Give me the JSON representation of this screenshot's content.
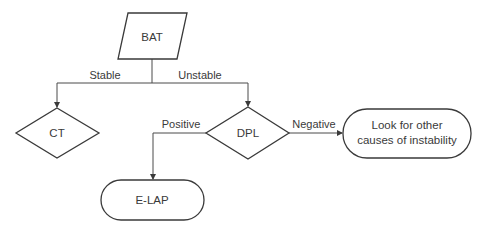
{
  "diagram": {
    "type": "flowchart",
    "nodes": {
      "bat": {
        "label": "BAT",
        "shape": "parallelogram"
      },
      "ct": {
        "label": "CT",
        "shape": "diamond"
      },
      "dpl": {
        "label": "DPL",
        "shape": "diamond"
      },
      "other": {
        "label_line1": "Look for other",
        "label_line2": "causes of instability",
        "shape": "terminator"
      },
      "elap": {
        "label": "E-LAP",
        "shape": "terminator"
      }
    },
    "edges": {
      "bat_ct": {
        "from": "BAT",
        "to": "CT",
        "label": "Stable"
      },
      "bat_dpl": {
        "from": "BAT",
        "to": "DPL",
        "label": "Unstable"
      },
      "dpl_elap": {
        "from": "DPL",
        "to": "E-LAP",
        "label": "Positive"
      },
      "dpl_other": {
        "from": "DPL",
        "to": "Look for other causes of instability",
        "label": "Negative"
      }
    },
    "colors": {
      "stroke": "#3a3a3a",
      "text": "#3a3a3a",
      "background": "#ffffff"
    }
  }
}
